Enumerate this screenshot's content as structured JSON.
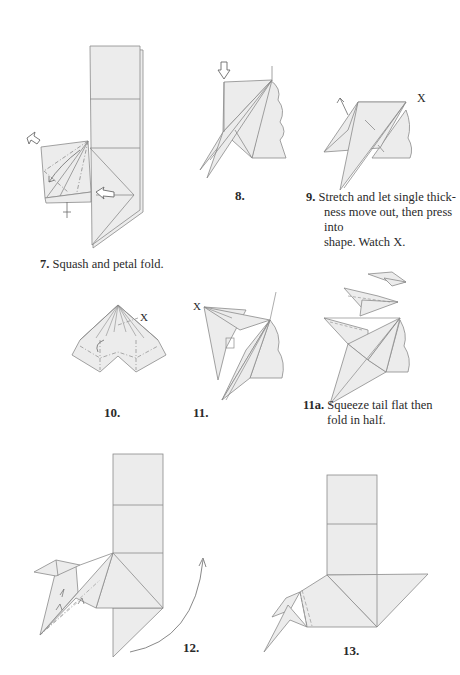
{
  "page": {
    "header": "",
    "paper_fill": "#ececec",
    "line_color": "#8a8a8a",
    "text_color": "#2a2a2a"
  },
  "steps": [
    {
      "id": "7",
      "number": "7.",
      "text": "Squash and petal fold."
    },
    {
      "id": "8",
      "number": "8.",
      "text": ""
    },
    {
      "id": "9",
      "number": "9.",
      "text": "Stretch and let single thick-",
      "text2": "ness move out, then press into",
      "text3": "shape. Watch X."
    },
    {
      "id": "10",
      "number": "10.",
      "text": ""
    },
    {
      "id": "11",
      "number": "11.",
      "text": ""
    },
    {
      "id": "11a",
      "number": "11a.",
      "text": "Squeeze tail flat then",
      "text2": "fold in half."
    },
    {
      "id": "12",
      "number": "12.",
      "text": ""
    },
    {
      "id": "13",
      "number": "13.",
      "text": ""
    }
  ],
  "markers": {
    "x9": "X",
    "x10": "X",
    "x11": "X"
  },
  "icons": {
    "push_arrow": "hollow-arrow",
    "fold_arrow": "curved-arrow",
    "reference_mark": "X"
  }
}
